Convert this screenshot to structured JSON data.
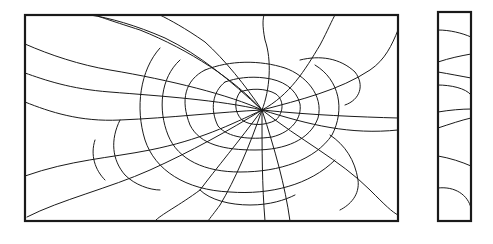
{
  "figure": {
    "title": "Shattered glass pane — front view and edge view",
    "stroke_color": "#1a1a1a",
    "background": "#ffffff"
  },
  "front_pane": {
    "x": 25,
    "y": 15,
    "width": 373,
    "height": 206,
    "impact_point": [
      262,
      110
    ],
    "radial_cracks": [
      "M262,110 C230,95 170,80 110,70 C80,65 50,55 25,44",
      "M262,110 C220,100 160,96 110,92 C70,89 45,80 25,73",
      "M262,110 C220,112 170,118 120,120 C80,122 50,112 25,102",
      "M262,110 C230,125 200,140 150,150 C110,158 70,160 25,176",
      "M262,110 C230,130 190,152 150,170 C110,188 60,200 27,217",
      "M262,110 C240,140 215,170 200,190 C180,205 160,215 155,221",
      "M262,110 C250,145 235,180 220,205 C215,212 210,218 208,221",
      "M262,110 C262,150 262,185 265,221",
      "M262,110 C275,150 285,185 290,221",
      "M262,110 C300,140 340,160 370,190 C385,205 392,212 398,215",
      "M262,110 C310,125 350,135 398,130",
      "M262,110 C310,115 360,117 398,118",
      "M262,110 C300,100 340,90 370,70 C385,60 392,45 398,30",
      "M262,110 C290,95 305,70 320,45 C328,30 332,20 335,15",
      "M262,110 C270,90 272,60 265,40 C262,25 263,18 264,15",
      "M262,110 C245,85 225,60 205,42 C185,28 170,20 160,15",
      "M262,110 C230,80 200,55 165,38 C135,25 110,18 90,15",
      "M262,110 C235,80 190,50 140,30 C115,22 100,17 95,15"
    ],
    "ring_cracks": [
      "M205,70 C185,80 180,100 190,125 C200,145 225,150 255,150 C285,150 310,140 318,118 C324,95 305,75 285,68 C260,60 230,60 205,70",
      "M225,82 C212,92 210,110 218,126 C228,138 250,140 272,137 C292,132 302,118 300,104 C296,88 282,80 265,78 C250,76 236,78 225,82",
      "M240,92 C234,100 234,112 242,120 C250,126 265,126 276,120 C284,112 284,100 276,94 C266,88 250,88 240,92",
      "M180,60 C160,78 158,110 168,135 C178,160 205,172 240,172 C280,172 315,160 332,135 C345,110 340,80 315,65",
      "M160,48 C140,70 135,108 145,140 C155,170 185,190 230,192 C270,195 310,185 335,160",
      "M300,60 C320,55 340,58 355,72 C365,85 360,100 345,105",
      "M120,120 C110,140 112,160 125,175 C135,185 150,190 160,190",
      "M330,135 C345,145 355,160 358,180 C360,195 350,205 340,210",
      "M95,140 C90,155 95,170 105,180",
      "M200,190 C210,200 230,205 250,205 C270,205 285,200 295,195"
    ]
  },
  "edge_pane": {
    "x": 438,
    "y": 12,
    "width": 33,
    "height": 209,
    "cracks": [
      "M438,30 C450,30 462,33 471,37",
      "M438,62 C450,58 460,56 471,54",
      "M438,72 C450,74 460,76 471,78",
      "M438,85 C450,85 466,88 471,95",
      "M438,112 C450,110 462,109 471,109",
      "M438,128 C450,124 462,120 471,118",
      "M438,156 C450,158 462,162 471,166",
      "M438,188 C455,186 468,195 471,208"
    ]
  }
}
